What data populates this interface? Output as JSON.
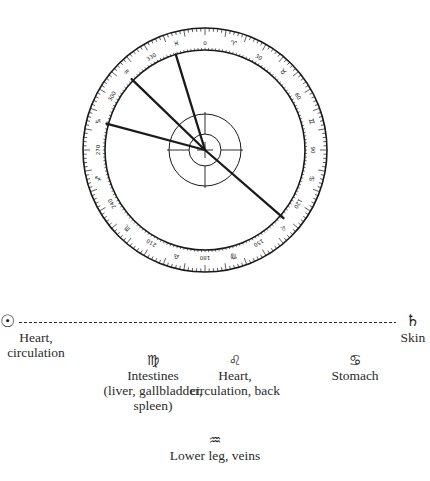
{
  "dial": {
    "center": [
      205,
      150
    ],
    "outer_radius": 122,
    "inner_radius": 100,
    "hub_radius": 36,
    "core_radius": 16,
    "scale_numbers": [
      "0",
      "30",
      "60",
      "90",
      "120",
      "150",
      "180",
      "210",
      "240",
      "270",
      "300",
      "330"
    ],
    "zodiac_ring": [
      "♈",
      "♉",
      "♊",
      "♋",
      "♌",
      "♍",
      "♎",
      "♏",
      "♐",
      "♑",
      "♒",
      "♓"
    ],
    "hands_deg": [
      105,
      128,
      168,
      318
    ],
    "stroke_color": "#1a1a1a"
  },
  "axis": {
    "left_symbol": "☉",
    "left_label_1": "Heart,",
    "left_label_2": "circulation",
    "right_symbol": "♄",
    "right_label": "Skin"
  },
  "items": [
    {
      "symbol": "♍",
      "lines": [
        "Intestines",
        "(liver, gallbladder,",
        "spleen)"
      ]
    },
    {
      "symbol": "♌",
      "lines": [
        "Heart,",
        "circulation, back"
      ]
    },
    {
      "symbol": "♋",
      "lines": [
        "Stomach"
      ]
    },
    {
      "symbol": "♒",
      "lines": [
        "Lower leg, veins"
      ]
    }
  ]
}
